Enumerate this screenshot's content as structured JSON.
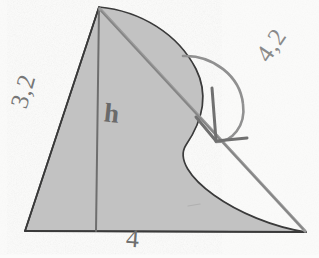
{
  "figure": {
    "background_color": "#fbfbfa",
    "fill_color": "#c2c2c2",
    "outline_color": "#3a3a3a",
    "pencil_color": "#8a8a8a"
  },
  "labels": {
    "left_side": "3,2",
    "height": "h",
    "slant": "4,2",
    "base": "4"
  },
  "geometry": {
    "apex": [
      99,
      7
    ],
    "bottom_left": [
      25,
      231
    ],
    "bottom_right_tip": [
      306,
      232
    ],
    "curve_bulge": [
      205,
      95
    ],
    "height_foot": [
      95,
      231
    ],
    "arrow_start": [
      183,
      56
    ],
    "arrow_tip": [
      215,
      140
    ]
  },
  "annotations": {
    "arrow_name": "curved-measurement-arrow",
    "diagonal_name": "slant-line",
    "vertical_name": "height-line"
  }
}
